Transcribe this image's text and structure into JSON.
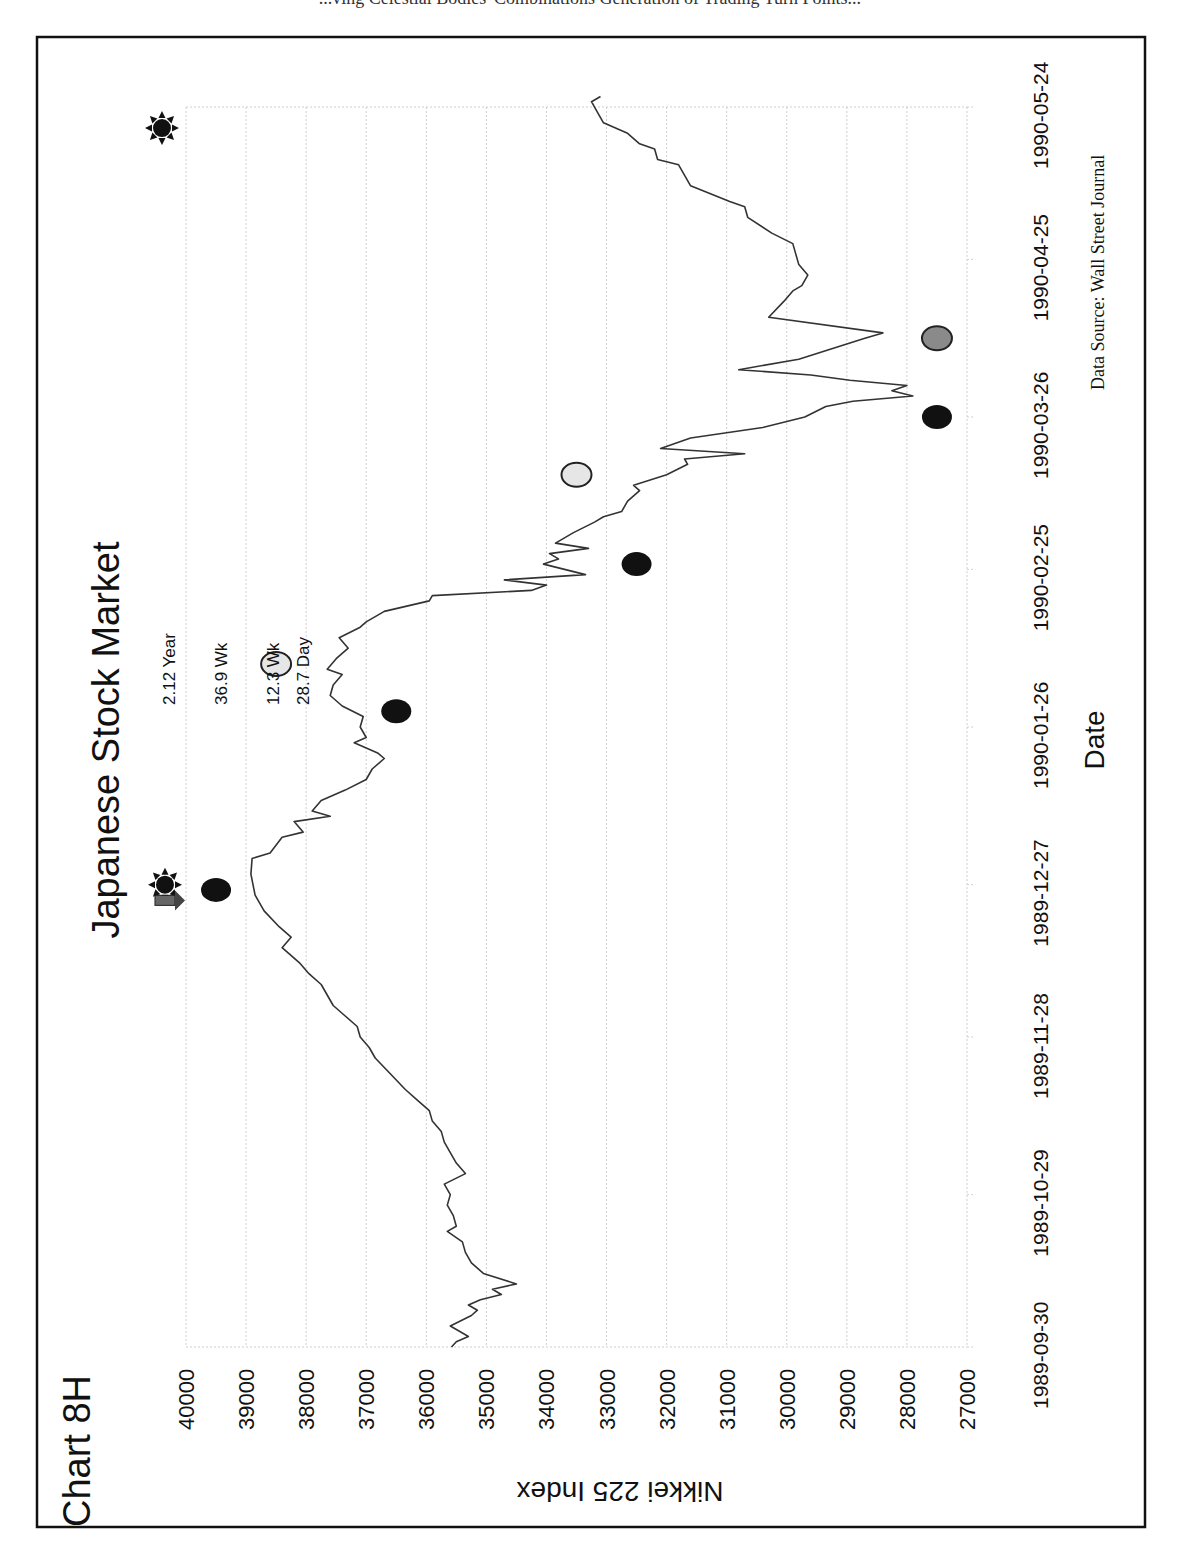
{
  "page": {
    "top_cut_text": "...ving Celestial Bodies' Combinations Generation of Trading Turn Points..."
  },
  "chart_id": "Chart 8H",
  "source_note": "Data Source:  Wall Street Journal",
  "annotations": {
    "cycle_labels": [
      "2.12 Year",
      "36.9 Wk",
      "12.3 Wk",
      "28.7 Day"
    ]
  },
  "colors": {
    "line": "#333333",
    "marker_black": "#111111",
    "marker_light": "#e6e6e6",
    "marker_gray": "#8a8a8a",
    "grid": "#cfcfcf",
    "frame": "#111111"
  },
  "chart_data": {
    "type": "line",
    "title": "Japanese Stock Market",
    "xlabel": "Date",
    "ylabel": "Nikkei 225 Index",
    "orientation": "rotated 90 degrees counter-clockwise on page",
    "ylim": [
      27000,
      40000
    ],
    "yticks": [
      40000,
      39000,
      38000,
      37000,
      36000,
      35000,
      34000,
      33000,
      32000,
      31000,
      30000,
      29000,
      28000,
      27000
    ],
    "xticks": [
      "1989-09-30",
      "1989-10-29",
      "1989-11-28",
      "1989-12-27",
      "1990-01-26",
      "1990-02-25",
      "1990-03-26",
      "1990-04-25",
      "1990-05-24"
    ],
    "grid": true,
    "legend": null,
    "series": [
      {
        "name": "Nikkei 225 Index",
        "points": [
          [
            "1989-09-30",
            35580
          ],
          [
            "1989-10-01",
            35500
          ],
          [
            "1989-10-02",
            35300
          ],
          [
            "1989-10-03",
            35450
          ],
          [
            "1989-10-04",
            35600
          ],
          [
            "1989-10-06",
            35250
          ],
          [
            "1989-10-07",
            35150
          ],
          [
            "1989-10-08",
            35300
          ],
          [
            "1989-10-09",
            35100
          ],
          [
            "1989-10-10",
            34750
          ],
          [
            "1989-10-11",
            34900
          ],
          [
            "1989-10-12",
            34500
          ],
          [
            "1989-10-14",
            35050
          ],
          [
            "1989-10-16",
            35250
          ],
          [
            "1989-10-18",
            35350
          ],
          [
            "1989-10-20",
            35400
          ],
          [
            "1989-10-22",
            35650
          ],
          [
            "1989-10-23",
            35500
          ],
          [
            "1989-10-25",
            35550
          ],
          [
            "1989-10-27",
            35650
          ],
          [
            "1989-10-29",
            35600
          ],
          [
            "1989-10-31",
            35700
          ],
          [
            "1989-11-02",
            35350
          ],
          [
            "1989-11-04",
            35500
          ],
          [
            "1989-11-06",
            35600
          ],
          [
            "1989-11-08",
            35700
          ],
          [
            "1989-11-10",
            35750
          ],
          [
            "1989-11-12",
            35900
          ],
          [
            "1989-11-14",
            35950
          ],
          [
            "1989-11-16",
            36150
          ],
          [
            "1989-11-18",
            36350
          ],
          [
            "1989-11-21",
            36600
          ],
          [
            "1989-11-24",
            36850
          ],
          [
            "1989-11-26",
            36950
          ],
          [
            "1989-11-28",
            37100
          ],
          [
            "1989-11-30",
            37150
          ],
          [
            "1989-12-02",
            37350
          ],
          [
            "1989-12-04",
            37550
          ],
          [
            "1989-12-06",
            37650
          ],
          [
            "1989-12-08",
            37750
          ],
          [
            "1989-12-10",
            37950
          ],
          [
            "1989-12-12",
            38100
          ],
          [
            "1989-12-14",
            38300
          ],
          [
            "1989-12-15",
            38400
          ],
          [
            "1989-12-17",
            38250
          ],
          [
            "1989-12-19",
            38450
          ],
          [
            "1989-12-22",
            38700
          ],
          [
            "1989-12-25",
            38850
          ],
          [
            "1989-12-29",
            38920
          ],
          [
            "1990-01-01",
            38900
          ],
          [
            "1990-01-02",
            38600
          ],
          [
            "1990-01-05",
            38400
          ],
          [
            "1990-01-06",
            38050
          ],
          [
            "1990-01-08",
            38200
          ],
          [
            "1990-01-09",
            37600
          ],
          [
            "1990-01-10",
            37900
          ],
          [
            "1990-01-12",
            37750
          ],
          [
            "1990-01-14",
            37350
          ],
          [
            "1990-01-16",
            37000
          ],
          [
            "1990-01-18",
            36900
          ],
          [
            "1990-01-20",
            36700
          ],
          [
            "1990-01-21",
            36800
          ],
          [
            "1990-01-23",
            37200
          ],
          [
            "1990-01-24",
            37000
          ],
          [
            "1990-01-26",
            37100
          ],
          [
            "1990-01-28",
            37050
          ],
          [
            "1990-01-30",
            37400
          ],
          [
            "1990-02-01",
            37600
          ],
          [
            "1990-02-03",
            37550
          ],
          [
            "1990-02-05",
            37400
          ],
          [
            "1990-02-06",
            37650
          ],
          [
            "1990-02-08",
            37500
          ],
          [
            "1990-02-10",
            37300
          ],
          [
            "1990-02-12",
            37450
          ],
          [
            "1990-02-14",
            37100
          ],
          [
            "1990-02-15",
            37000
          ],
          [
            "1990-02-17",
            36700
          ],
          [
            "1990-02-19",
            35950
          ],
          [
            "1990-02-20",
            35900
          ],
          [
            "1990-02-21",
            34250
          ],
          [
            "1990-02-22",
            34000
          ],
          [
            "1990-02-23",
            34700
          ],
          [
            "1990-02-24",
            33350
          ],
          [
            "1990-02-26",
            34050
          ],
          [
            "1990-02-27",
            33800
          ],
          [
            "1990-02-28",
            33950
          ],
          [
            "1990-03-01",
            33300
          ],
          [
            "1990-03-02",
            33850
          ],
          [
            "1990-03-04",
            33550
          ],
          [
            "1990-03-06",
            33200
          ],
          [
            "1990-03-07",
            33050
          ],
          [
            "1990-03-08",
            32750
          ],
          [
            "1990-03-10",
            32650
          ],
          [
            "1990-03-12",
            32450
          ],
          [
            "1990-03-13",
            32550
          ],
          [
            "1990-03-15",
            32000
          ],
          [
            "1990-03-17",
            31650
          ],
          [
            "1990-03-18",
            31700
          ],
          [
            "1990-03-19",
            30700
          ],
          [
            "1990-03-20",
            32100
          ],
          [
            "1990-03-22",
            31600
          ],
          [
            "1990-03-24",
            30400
          ],
          [
            "1990-03-26",
            29700
          ],
          [
            "1990-03-28",
            29350
          ],
          [
            "1990-03-29",
            28900
          ],
          [
            "1990-03-30",
            27900
          ],
          [
            "1990-03-31",
            28250
          ],
          [
            "1990-04-01",
            28000
          ],
          [
            "1990-04-02",
            28950
          ],
          [
            "1990-04-03",
            29600
          ],
          [
            "1990-04-04",
            30800
          ],
          [
            "1990-04-06",
            29800
          ],
          [
            "1990-04-08",
            29250
          ],
          [
            "1990-04-10",
            28700
          ],
          [
            "1990-04-11",
            28400
          ],
          [
            "1990-04-14",
            30300
          ],
          [
            "1990-04-17",
            30050
          ],
          [
            "1990-04-19",
            29900
          ],
          [
            "1990-04-20",
            29750
          ],
          [
            "1990-04-22",
            29650
          ],
          [
            "1990-04-24",
            29800
          ],
          [
            "1990-04-26",
            29850
          ],
          [
            "1990-04-28",
            29900
          ],
          [
            "1990-04-30",
            30250
          ],
          [
            "1990-05-03",
            30650
          ],
          [
            "1990-05-05",
            30700
          ],
          [
            "1990-05-06",
            30950
          ],
          [
            "1990-05-09",
            31600
          ],
          [
            "1990-05-11",
            31700
          ],
          [
            "1990-05-13",
            31800
          ],
          [
            "1990-05-14",
            32150
          ],
          [
            "1990-05-16",
            32200
          ],
          [
            "1990-05-17",
            32450
          ],
          [
            "1990-05-19",
            32650
          ],
          [
            "1990-05-21",
            33050
          ],
          [
            "1990-05-23",
            33150
          ],
          [
            "1990-05-25",
            33250
          ],
          [
            "1990-05-26",
            33100
          ]
        ]
      }
    ],
    "markers": [
      {
        "type": "sun-symbol",
        "date": "1989-12-27",
        "value": 40350,
        "note": "planetary turn symbol near title"
      },
      {
        "type": "arrow-down",
        "date": "1989-12-24",
        "value": 40350
      },
      {
        "type": "dot-black",
        "date": "1989-12-26",
        "value": 39500,
        "label": "2.12 Year"
      },
      {
        "type": "dot-black",
        "date": "1990-01-29",
        "value": 36500,
        "label": "36.9 Wk"
      },
      {
        "type": "dot-light",
        "date": "1990-02-07",
        "value": 38500,
        "label": "12.3 Wk / 28.7 Day"
      },
      {
        "type": "dot-black",
        "date": "1990-02-26",
        "value": 32500
      },
      {
        "type": "dot-light",
        "date": "1990-03-15",
        "value": 33500
      },
      {
        "type": "dot-black",
        "date": "1990-03-26",
        "value": 27500
      },
      {
        "type": "dot-gray",
        "date": "1990-04-10",
        "value": 27500
      },
      {
        "type": "sun-symbol",
        "date": "1990-05-20",
        "value": 40400
      }
    ]
  }
}
